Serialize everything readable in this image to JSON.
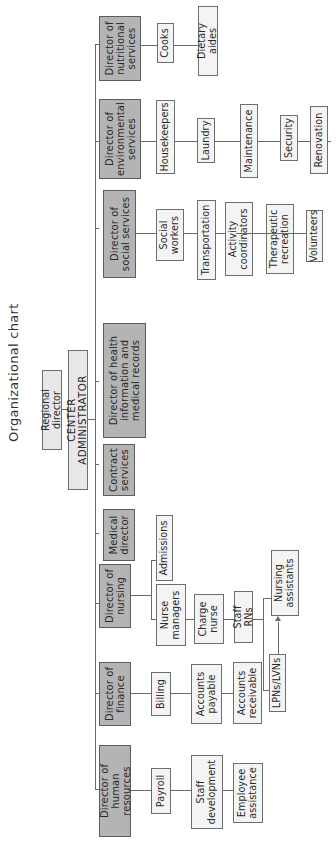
{
  "title": "Organizational chart",
  "top": {
    "regional_director": "Regional director",
    "center_administrator": "CENTER ADMINISTRATOR"
  },
  "directors": [
    {
      "name": "Director of human resources",
      "reports": [
        "Payroll",
        "Staff development",
        "Employee assistance"
      ]
    },
    {
      "name": "Director of finance",
      "reports": [
        "Billing",
        "Accounts payable",
        "Accounts receivable"
      ]
    },
    {
      "name": "Director of nursing",
      "reports": [
        "Admissions",
        "Nurse managers",
        "Charge nurse",
        "Staff RNs",
        "Nursing assistants",
        "LPNs/LVNs"
      ]
    },
    {
      "name": "Medical director",
      "reports": []
    },
    {
      "name": "Contract services",
      "reports": []
    },
    {
      "name": "Director of health information and medical records",
      "reports": []
    },
    {
      "name": "Director of social services",
      "reports": [
        "Social workers",
        "Transportation",
        "Activity coordinators",
        "Therapeutic recreation",
        "Volunteers"
      ]
    },
    {
      "name": "Director of environmental services",
      "reports": [
        "Housekeepers",
        "Laundry",
        "Maintenance",
        "Security",
        "Renovation"
      ]
    },
    {
      "name": "Director of nutritional services",
      "reports": [
        "Cooks",
        "Dietary aides"
      ]
    }
  ],
  "colors": {
    "director_fill": "#b4b4b4",
    "staff_fill": "#f4f4f4",
    "line": "#6a6a6a"
  }
}
